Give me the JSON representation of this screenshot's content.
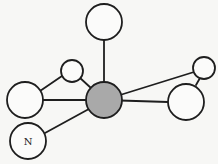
{
  "diagram": {
    "type": "ball-and-stick molecular model",
    "colors": {
      "central_atom": "#a9a9a9",
      "outer_atom": "#fbfbfa",
      "stroke": "#1e1e1e"
    },
    "atoms": [
      {
        "id": "center",
        "label": "",
        "cx": 104,
        "cy": 100,
        "r": 18,
        "shaded": true
      },
      {
        "id": "top",
        "label": "",
        "cx": 104,
        "cy": 22,
        "r": 18
      },
      {
        "id": "upper-left-small",
        "label": "",
        "cx": 72,
        "cy": 71,
        "r": 11
      },
      {
        "id": "left",
        "label": "",
        "cx": 25,
        "cy": 100,
        "r": 18
      },
      {
        "id": "upper-right-small",
        "label": "",
        "cx": 204,
        "cy": 68,
        "r": 11
      },
      {
        "id": "right",
        "label": "",
        "cx": 186,
        "cy": 102,
        "r": 18
      },
      {
        "id": "nitrogen",
        "label": "N",
        "cx": 28,
        "cy": 141,
        "r": 18
      }
    ],
    "bonds": [
      [
        "center",
        "top"
      ],
      [
        "center",
        "upper-left-small"
      ],
      [
        "center",
        "left"
      ],
      [
        "center",
        "upper-right-small"
      ],
      [
        "center",
        "right"
      ],
      [
        "center",
        "nitrogen"
      ],
      [
        "left",
        "upper-left-small"
      ],
      [
        "right",
        "upper-right-small"
      ]
    ]
  }
}
